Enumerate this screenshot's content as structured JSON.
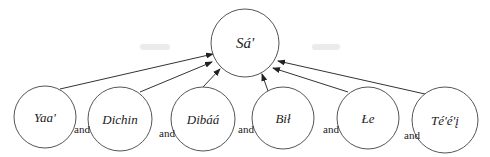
{
  "diagram": {
    "root": {
      "label": "Sá'",
      "cx": 245,
      "cy": 43,
      "r": 34
    },
    "children": [
      {
        "label": "Yaa'",
        "cx": 45,
        "cy": 117,
        "r": 31
      },
      {
        "label": "Dichin",
        "cx": 120,
        "cy": 119,
        "r": 32
      },
      {
        "label": "Dibáá",
        "cx": 203,
        "cy": 119,
        "r": 32
      },
      {
        "label": "Bił",
        "cx": 283,
        "cy": 118,
        "r": 31
      },
      {
        "label": "Łe",
        "cx": 368,
        "cy": 118,
        "r": 31
      },
      {
        "label": "Té'é'į",
        "cx": 445,
        "cy": 120,
        "r": 33
      }
    ],
    "connectors": [
      {
        "label": "and",
        "x": 74,
        "y": 133
      },
      {
        "label": "and",
        "x": 159,
        "y": 137
      },
      {
        "label": "and",
        "x": 238,
        "y": 133
      },
      {
        "label": "and",
        "x": 323,
        "y": 133
      },
      {
        "label": "and",
        "x": 404,
        "y": 139
      }
    ],
    "edges": [
      {
        "from": "Yaa'",
        "x1": 60,
        "y1": 89,
        "x2": 213,
        "y2": 54
      },
      {
        "from": "Dichin",
        "x1": 140,
        "y1": 92,
        "x2": 212,
        "y2": 62
      },
      {
        "from": "Dibáá",
        "x1": 203,
        "y1": 87,
        "x2": 220,
        "y2": 69
      },
      {
        "from": "Bił",
        "x1": 268,
        "y1": 91,
        "x2": 262,
        "y2": 74
      },
      {
        "from": "Łe",
        "x1": 348,
        "y1": 92,
        "x2": 273,
        "y2": 68
      },
      {
        "from": "Té'é'į",
        "x1": 425,
        "y1": 94,
        "x2": 278,
        "y2": 61
      }
    ],
    "colors": {
      "stroke": "#555555",
      "edge": "#333333",
      "text": "#222222",
      "background": "#ffffff"
    }
  }
}
